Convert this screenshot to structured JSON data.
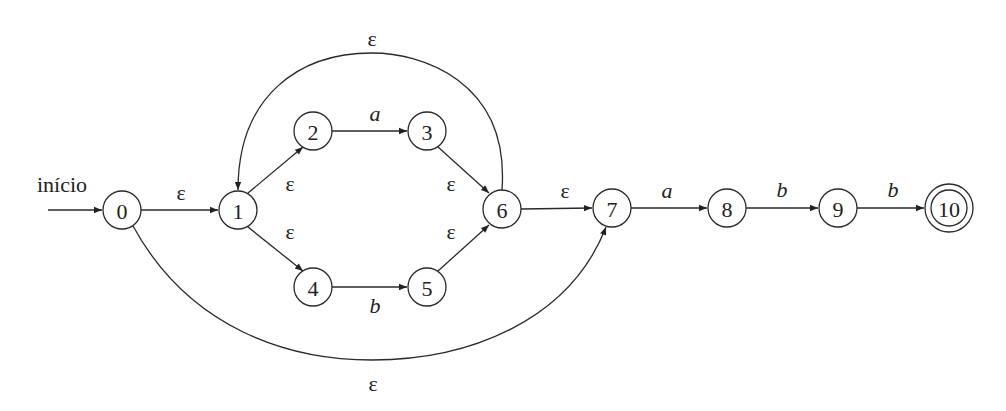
{
  "diagram": {
    "type": "nfa",
    "start_label": "início",
    "nodes": [
      {
        "id": "0",
        "label": "0",
        "x": 122,
        "y": 210,
        "accepting": false
      },
      {
        "id": "1",
        "label": "1",
        "x": 238,
        "y": 210,
        "accepting": false
      },
      {
        "id": "2",
        "label": "2",
        "x": 313,
        "y": 131,
        "accepting": false
      },
      {
        "id": "3",
        "label": "3",
        "x": 427,
        "y": 131,
        "accepting": false
      },
      {
        "id": "4",
        "label": "4",
        "x": 313,
        "y": 287,
        "accepting": false
      },
      {
        "id": "5",
        "label": "5",
        "x": 427,
        "y": 287,
        "accepting": false
      },
      {
        "id": "6",
        "label": "6",
        "x": 502,
        "y": 209,
        "accepting": false
      },
      {
        "id": "7",
        "label": "7",
        "x": 612,
        "y": 208,
        "accepting": false
      },
      {
        "id": "8",
        "label": "8",
        "x": 727,
        "y": 208,
        "accepting": false
      },
      {
        "id": "9",
        "label": "9",
        "x": 838,
        "y": 208,
        "accepting": false
      },
      {
        "id": "10",
        "label": "10",
        "x": 949,
        "y": 208,
        "accepting": true
      }
    ],
    "edges": [
      {
        "from": "0",
        "to": "1",
        "label": "ε"
      },
      {
        "from": "1",
        "to": "2",
        "label": "ε"
      },
      {
        "from": "1",
        "to": "4",
        "label": "ε"
      },
      {
        "from": "2",
        "to": "3",
        "label": "a"
      },
      {
        "from": "4",
        "to": "5",
        "label": "b"
      },
      {
        "from": "3",
        "to": "6",
        "label": "ε"
      },
      {
        "from": "5",
        "to": "6",
        "label": "ε"
      },
      {
        "from": "6",
        "to": "1",
        "label": "ε"
      },
      {
        "from": "6",
        "to": "7",
        "label": "ε"
      },
      {
        "from": "0",
        "to": "7",
        "label": "ε"
      },
      {
        "from": "7",
        "to": "8",
        "label": "a"
      },
      {
        "from": "8",
        "to": "9",
        "label": "b"
      },
      {
        "from": "9",
        "to": "10",
        "label": "b"
      }
    ]
  }
}
